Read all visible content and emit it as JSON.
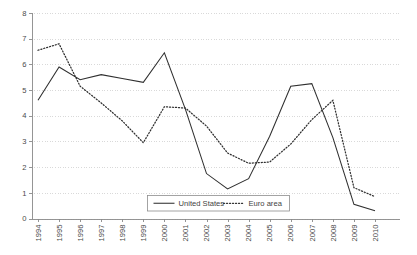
{
  "chart_data": {
    "type": "line",
    "title": "",
    "subtitle": "",
    "xlabel": "",
    "ylabel": "",
    "grid": true,
    "legend_position": "bottom-center",
    "ylim": [
      0,
      8
    ],
    "yticks": [
      "0",
      "1",
      "2",
      "3",
      "4",
      "5",
      "6",
      "7",
      "8"
    ],
    "categories": [
      "1994",
      "1995",
      "1996",
      "1997",
      "1998",
      "1999",
      "2000",
      "2001",
      "2002",
      "2003",
      "2004",
      "2005",
      "2006",
      "2007",
      "2008",
      "2009",
      "2010"
    ],
    "series": [
      {
        "name": "United States",
        "style": "solid",
        "color": "#2f2f2f",
        "values": [
          4.6,
          5.9,
          5.4,
          5.6,
          5.45,
          5.3,
          6.45,
          4.25,
          1.75,
          1.15,
          1.55,
          3.2,
          5.15,
          5.25,
          3.15,
          0.55,
          0.3
        ]
      },
      {
        "name": "Euro area",
        "style": "dotted",
        "color": "#2f2f2f",
        "values": [
          6.55,
          6.8,
          5.15,
          4.5,
          3.8,
          2.95,
          4.35,
          4.3,
          3.6,
          2.55,
          2.15,
          2.2,
          2.9,
          3.85,
          4.6,
          1.2,
          0.85
        ]
      }
    ]
  },
  "legend": {
    "items": [
      {
        "label": "United States",
        "style": "solid"
      },
      {
        "label": "Euro area",
        "style": "dotted"
      }
    ]
  }
}
